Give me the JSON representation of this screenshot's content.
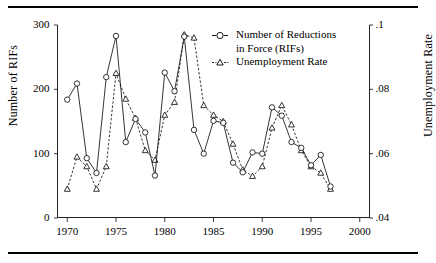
{
  "chart_data": {
    "type": "line",
    "title": "",
    "xlabel": "",
    "ylabel": "Number of RIFs",
    "ylabel_right": "Unemployment Rate",
    "x": [
      1970,
      1971,
      1972,
      1973,
      1974,
      1975,
      1976,
      1977,
      1978,
      1979,
      1980,
      1981,
      1982,
      1983,
      1984,
      1985,
      1986,
      1987,
      1988,
      1989,
      1990,
      1991,
      1992,
      1993,
      1994,
      1995,
      1996,
      1997
    ],
    "xlim": [
      1969,
      2001
    ],
    "xticks": [
      1970,
      1975,
      1980,
      1985,
      1990,
      1995,
      2000
    ],
    "xticklabels": [
      "1970",
      "1975",
      "1980",
      "1985",
      "1990",
      "1995",
      "2000"
    ],
    "ylim": [
      0,
      300
    ],
    "yticks": [
      0,
      100,
      200,
      300
    ],
    "yticklabels": [
      "0",
      "100",
      "200",
      "300"
    ],
    "ylim_right": [
      0.04,
      0.1
    ],
    "yticks_right": [
      0.04,
      0.06,
      0.08,
      0.1
    ],
    "yticklabels_right": [
      ".04",
      ".06",
      ".08",
      ".1"
    ],
    "grid": false,
    "legend_position": "upper right",
    "series": [
      {
        "name": "Number of Reductions in Force (RIFs)",
        "legend_line1": "Number of Reductions",
        "legend_line2": "in Force  (RIFs)",
        "marker": "circle",
        "linestyle": "solid",
        "axis": "left",
        "values": [
          184,
          209,
          93,
          70,
          219,
          283,
          118,
          154,
          133,
          66,
          226,
          197,
          282,
          137,
          100,
          151,
          148,
          86,
          71,
          102,
          100,
          172,
          159,
          118,
          109,
          82,
          98,
          49
        ]
      },
      {
        "name": "Unemployment Rate",
        "legend_line1": "Unemployment  Rate",
        "marker": "triangle",
        "linestyle": "dashed",
        "axis": "right",
        "values": [
          0.049,
          0.059,
          0.056,
          0.049,
          0.056,
          0.085,
          0.077,
          0.071,
          0.061,
          0.058,
          0.072,
          0.076,
          0.097,
          0.096,
          0.075,
          0.072,
          0.07,
          0.063,
          0.055,
          0.053,
          0.056,
          0.068,
          0.075,
          0.069,
          0.061,
          0.056,
          0.054,
          0.049
        ]
      }
    ]
  },
  "axes": {
    "left_label": "Number of RIFs",
    "right_label": "Unemployment Rate"
  },
  "legend": {
    "rif_line1": "Number of Reductions",
    "rif_line2": "in Force  (RIFs)",
    "unemp_line1": "Unemployment  Rate"
  }
}
